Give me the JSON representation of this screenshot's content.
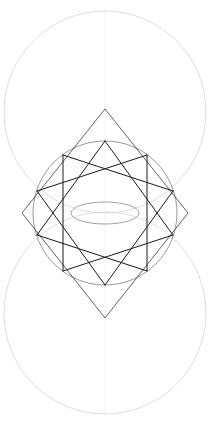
{
  "canvas": {
    "width": 215,
    "height": 434,
    "background": "#ffffff",
    "title": "Geometric Construction"
  },
  "palette": {
    "star_stroke": "#1a1a1a",
    "diamond_stroke": "#3a3a3a",
    "inner_circle_stroke": "#6e6e6e",
    "outer_circle_stroke": "#cfcfcf",
    "axis_stroke": "#e2e2e2",
    "lens_stroke": "#8a8a8a"
  },
  "chart_data": {
    "type": "scatter",
    "xlabel": "",
    "ylabel": "",
    "xlim": [
      0,
      215
    ],
    "ylim": [
      0,
      434
    ],
    "grid": false,
    "legend": "none",
    "center": {
      "x": 105,
      "y": 213
    },
    "outer_circles": [
      {
        "name": "upper-circle",
        "cx": 105,
        "cy": 112,
        "r": 101,
        "stroke": "#cfcfcf",
        "stroke_width": 0.7
      },
      {
        "name": "lower-circle",
        "cx": 105,
        "cy": 313,
        "r": 101,
        "stroke": "#cfcfcf",
        "stroke_width": 0.7
      }
    ],
    "inner_circle": {
      "name": "star-circumcircle",
      "cx": 105,
      "cy": 213,
      "r": 72,
      "stroke": "#6e6e6e",
      "stroke_width": 0.7
    },
    "lens": {
      "name": "vesica-lens",
      "cx": 105,
      "cy": 213,
      "rx": 34,
      "ry": 11,
      "stroke": "#7a7a7a",
      "stroke_width": 0.7
    },
    "vertical_axis": {
      "x": 105,
      "y1": 12,
      "y2": 414,
      "stroke": "#ededed",
      "stroke_width": 0.7
    },
    "diamond": {
      "name": "circumscribed-diamond",
      "points": [
        {
          "label": "top",
          "x": 105,
          "y": 109
        },
        {
          "label": "right",
          "x": 188,
          "y": 213
        },
        {
          "label": "bottom",
          "x": 105,
          "y": 318
        },
        {
          "label": "left",
          "x": 22,
          "y": 213
        }
      ],
      "stroke": "#3a3a3a",
      "stroke_width": 0.8
    },
    "star": {
      "name": "decagram",
      "points_count": 10,
      "step": 3,
      "radius": 72,
      "start_angle_deg": -90,
      "stroke": "#1a1a1a",
      "stroke_width": 1.0,
      "vertices": [
        {
          "index": 0,
          "angle_deg": -90,
          "x": 105,
          "y": 141
        },
        {
          "index": 1,
          "angle_deg": -54,
          "x": 147,
          "y": 155
        },
        {
          "index": 2,
          "angle_deg": -18,
          "x": 173,
          "y": 191
        },
        {
          "index": 3,
          "angle_deg": 18,
          "x": 173,
          "y": 235
        },
        {
          "index": 4,
          "angle_deg": 54,
          "x": 147,
          "y": 271
        },
        {
          "index": 5,
          "angle_deg": 90,
          "x": 105,
          "y": 285
        },
        {
          "index": 6,
          "angle_deg": 126,
          "x": 63,
          "y": 271
        },
        {
          "index": 7,
          "angle_deg": 162,
          "x": 37,
          "y": 235
        },
        {
          "index": 8,
          "angle_deg": 198,
          "x": 37,
          "y": 191
        },
        {
          "index": 9,
          "angle_deg": 234,
          "x": 63,
          "y": 155
        }
      ]
    }
  }
}
